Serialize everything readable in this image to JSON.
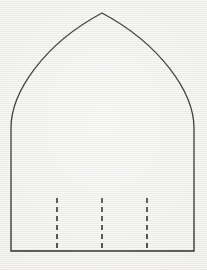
{
  "canvas": {
    "width": 207,
    "height": 270,
    "background_color": "#f1f0ee",
    "texture": "horizontal-scanline-paper"
  },
  "figure": {
    "name": "pointed-lancet-arch-outline",
    "stroke_color": "#2b2b2b",
    "stroke_width": 1.3,
    "fill": "none",
    "geometry": {
      "apex": [
        102,
        13
      ],
      "left_springing": [
        11,
        128
      ],
      "right_springing": [
        194,
        128
      ],
      "base_left": [
        11,
        251
      ],
      "base_right": [
        194,
        251
      ],
      "left_curve_control": [
        24,
        43
      ],
      "right_curve_control": [
        180,
        43
      ],
      "path": "M 11 251 L 11 128 C 11 92 44 44 102 13 C 160 44 194 92 194 128 L 194 251 Z"
    }
  },
  "guides": {
    "name": "dashed-vertical-guides",
    "stroke_color": "#4a4a4a",
    "stroke_width": 2,
    "dash_length": 5,
    "gap_length": 4,
    "top_y": 198,
    "bottom_y": 251,
    "lines": [
      {
        "label": "guide-1",
        "x": 57
      },
      {
        "label": "guide-2",
        "x": 102
      },
      {
        "label": "guide-3",
        "x": 147
      }
    ]
  },
  "chart_data": {
    "type": "diagram",
    "title": "",
    "shapes": [
      {
        "kind": "pointed-arch-outline",
        "vertices": [
          [
            11,
            251
          ],
          [
            11,
            128
          ],
          [
            102,
            13
          ],
          [
            194,
            128
          ],
          [
            194,
            251
          ]
        ],
        "curved_segments": [
          {
            "from": [
              11,
              128
            ],
            "to": [
              102,
              13
            ],
            "control": [
              24,
              43
            ]
          },
          {
            "from": [
              102,
              13
            ],
            "to": [
              194,
              128
            ],
            "control": [
              180,
              43
            ]
          }
        ],
        "closed": true,
        "stroke": "#2b2b2b",
        "fill": "none"
      }
    ],
    "annotations": [
      {
        "kind": "dashed-line",
        "x": 57,
        "y_from": 198,
        "y_to": 251
      },
      {
        "kind": "dashed-line",
        "x": 102,
        "y_from": 198,
        "y_to": 251
      },
      {
        "kind": "dashed-line",
        "x": 147,
        "y_from": 198,
        "y_to": 251
      }
    ]
  }
}
